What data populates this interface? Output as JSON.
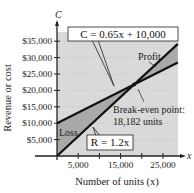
{
  "chart_data": {
    "type": "line",
    "title": "",
    "xlabel": "Number of units (x)",
    "ylabel": "Revenue or cost",
    "x_axis_var": "x",
    "y_axis_var": "C",
    "xlim": [
      0,
      28500
    ],
    "ylim": [
      0,
      37500
    ],
    "x_ticks": [
      5000,
      10000,
      15000,
      20000,
      25000
    ],
    "x_tick_labels": [
      "5,000",
      "",
      "15,000",
      "",
      "25,000"
    ],
    "y_ticks": [
      5000,
      10000,
      15000,
      20000,
      25000,
      30000,
      35000
    ],
    "y_tick_labels": [
      "$5,000",
      "$10,000",
      "$15,000",
      "$20,000",
      "$25,000",
      "$30,000",
      "$35,000"
    ],
    "grid": "dotted horizontal",
    "series": [
      {
        "name": "C = 0.65x + 10,000",
        "kind": "cost",
        "slope": 0.65,
        "intercept": 10000,
        "x": [
          0,
          28500
        ],
        "values": [
          10000,
          28525
        ]
      },
      {
        "name": "R = 1.2x",
        "kind": "revenue",
        "slope": 1.2,
        "intercept": 0,
        "x": [
          0,
          28500
        ],
        "values": [
          0,
          34200
        ]
      }
    ],
    "break_even": {
      "x": 18182,
      "y": 21818
    },
    "regions": [
      {
        "label": "Loss",
        "x_range": [
          0,
          18182
        ]
      },
      {
        "label": "Profit",
        "x_range": [
          18182,
          28500
        ]
      }
    ],
    "annotations": {
      "cost_equation": "C = 0.65x + 10,000",
      "revenue_equation": "R = 1.2x",
      "profit_label": "Profit",
      "loss_label": "Loss",
      "break_even_line1": "Break-even point:",
      "break_even_line2": "18,182 units"
    },
    "colors": {
      "plot_background": "#d9d9d9",
      "region_fill": "#a9a9a9",
      "line": "#111111",
      "grid": "#bdbdbd"
    }
  }
}
